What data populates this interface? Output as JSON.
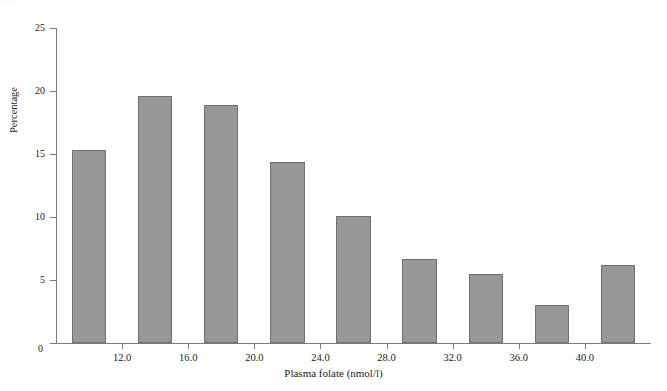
{
  "figure": {
    "background_color": "#ffffff",
    "scan_artifact_text": "· · ·"
  },
  "chart_data": {
    "type": "bar",
    "title": "",
    "subtitle": "",
    "xlabel": "Plasma folate (nmol/l)",
    "ylabel": "Percentage",
    "categories": [
      "10.0",
      "14.0",
      "18.0",
      "22.0",
      "26.0",
      "30.0",
      "34.0",
      "38.0",
      "42.0"
    ],
    "x": [
      10.0,
      14.0,
      18.0,
      22.0,
      26.0,
      30.0,
      34.0,
      38.0,
      42.0
    ],
    "values": [
      15.3,
      19.6,
      18.9,
      14.4,
      10.1,
      6.7,
      5.5,
      3.0,
      6.2
    ],
    "bin_width": 4.0,
    "xlim": [
      8.0,
      44.0
    ],
    "ylim": [
      0,
      25
    ],
    "xticks": [
      12.0,
      16.0,
      20.0,
      24.0,
      28.0,
      32.0,
      36.0,
      40.0
    ],
    "xtick_labels": [
      "12.0",
      "16.0",
      "20.0",
      "24.0",
      "28.0",
      "32.0",
      "36.0",
      "40.0"
    ],
    "yticks": [
      0,
      5,
      10,
      15,
      20,
      25
    ],
    "ytick_labels": [
      "0",
      "5",
      "10",
      "15",
      "20",
      "25"
    ],
    "grid": false,
    "legend": null,
    "legend_position": "none",
    "bar_color": "#989898",
    "bar_edge_color": "#6f6f6f",
    "axis_color": "#7c7c7c"
  },
  "axis": {
    "origin_label": "0"
  }
}
